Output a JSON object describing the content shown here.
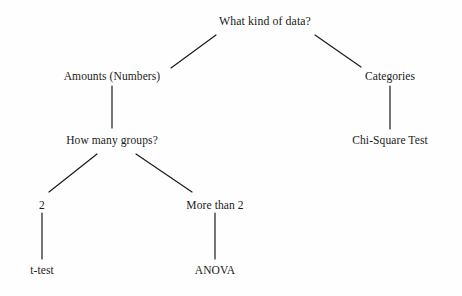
{
  "diagram": {
    "background_color": "#fefefe",
    "line_color": "#1a1a1a",
    "text_color": "#1a1a1a",
    "nodes": [
      {
        "id": "root",
        "label": "What kind of data?",
        "x": 265,
        "y": 21,
        "kind": "question"
      },
      {
        "id": "amounts",
        "label": "Amounts (Numbers)",
        "x": 112,
        "y": 76,
        "kind": "branch"
      },
      {
        "id": "categories",
        "label": "Categories",
        "x": 390,
        "y": 76,
        "kind": "branch"
      },
      {
        "id": "groups",
        "label": "How many groups?",
        "x": 112,
        "y": 140,
        "kind": "question"
      },
      {
        "id": "chisquare",
        "label": "Chi-Square Test",
        "x": 390,
        "y": 140,
        "kind": "leaf"
      },
      {
        "id": "two",
        "label": "2",
        "x": 42,
        "y": 205,
        "kind": "branch"
      },
      {
        "id": "morethan2",
        "label": "More than 2",
        "x": 215,
        "y": 205,
        "kind": "branch"
      },
      {
        "id": "ttest",
        "label": "t-test",
        "x": 42,
        "y": 270,
        "kind": "leaf"
      },
      {
        "id": "anova",
        "label": "ANOVA",
        "x": 215,
        "y": 270,
        "kind": "leaf"
      }
    ],
    "edges": [
      {
        "id": "root-amounts",
        "from": "root",
        "to": "amounts",
        "x1": 216,
        "y1": 35,
        "x2": 171,
        "y2": 68
      },
      {
        "id": "root-categories",
        "from": "root",
        "to": "categories",
        "x1": 315,
        "y1": 35,
        "x2": 361,
        "y2": 67
      },
      {
        "id": "amounts-groups",
        "from": "amounts",
        "to": "groups",
        "x1": 112,
        "y1": 86,
        "x2": 112,
        "y2": 128
      },
      {
        "id": "categories-chisquare",
        "from": "categories",
        "to": "chisquare",
        "x1": 390,
        "y1": 86,
        "x2": 390,
        "y2": 129
      },
      {
        "id": "groups-two",
        "from": "groups",
        "to": "two",
        "x1": 97,
        "y1": 154,
        "x2": 49,
        "y2": 192
      },
      {
        "id": "groups-morethan2",
        "from": "groups",
        "to": "morethan2",
        "x1": 136,
        "y1": 154,
        "x2": 192,
        "y2": 192
      },
      {
        "id": "two-ttest",
        "from": "two",
        "to": "ttest",
        "x1": 42,
        "y1": 213,
        "x2": 42,
        "y2": 259
      },
      {
        "id": "morethan2-anova",
        "from": "morethan2",
        "to": "anova",
        "x1": 215,
        "y1": 213,
        "x2": 215,
        "y2": 259
      }
    ]
  }
}
